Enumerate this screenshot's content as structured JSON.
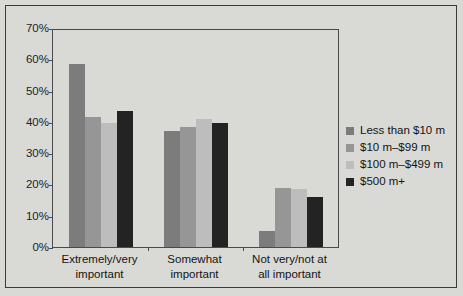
{
  "chart_data": {
    "type": "bar",
    "title": "",
    "subtitle": "",
    "xlabel": "",
    "ylabel": "",
    "ylim": [
      0,
      70
    ],
    "ytick_labels": [
      "70%",
      "60%",
      "50%",
      "40%",
      "30%",
      "20%",
      "10%",
      "0%"
    ],
    "ytick_values": [
      70,
      60,
      50,
      40,
      30,
      20,
      10,
      0
    ],
    "grid": false,
    "legend_position": "right",
    "categories": [
      "Extremely/very\nimportant",
      "Somewhat\nimportant",
      "Not very/not at\nall important"
    ],
    "series": [
      {
        "name": "Less than $10 m",
        "color": "#7c7c7c",
        "values": [
          58.5,
          37,
          5
        ]
      },
      {
        "name": "$10 m–$99 m",
        "color": "#969696",
        "values": [
          41.5,
          38.5,
          19
        ]
      },
      {
        "name": "$100 m–$499 m",
        "color": "#bdbdbd",
        "values": [
          39.5,
          41,
          18.5
        ]
      },
      {
        "name": "$500 m+",
        "color": "#232323",
        "values": [
          43.5,
          39.5,
          16
        ]
      }
    ]
  },
  "colors": {
    "background": "#d9d9d6",
    "frame": "#3b3b3b",
    "axis": "#4a4a4a",
    "text": "#141414"
  }
}
